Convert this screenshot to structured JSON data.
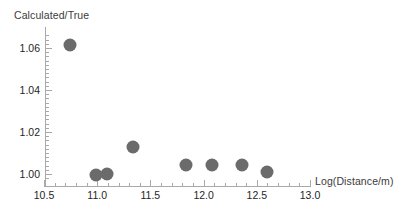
{
  "chart_data": {
    "type": "scatter",
    "title": "",
    "xlabel": "Log(Distance/m)",
    "ylabel": "Calculated/True",
    "xlim": [
      10.4,
      13.05
    ],
    "ylim": [
      0.9955,
      1.069
    ],
    "grid": false,
    "legend": null,
    "marker": {
      "shape": "circle",
      "color": "#6b6b6b",
      "diameter_px": 13
    },
    "xticks": [
      "10.5",
      "11.0",
      "11.5",
      "12.0",
      "12.5",
      "13.0"
    ],
    "xtick_values": [
      10.5,
      11.0,
      11.5,
      12.0,
      12.5,
      13.0
    ],
    "yticks": [
      "1.00",
      "1.02",
      "1.04",
      "1.06"
    ],
    "ytick_values": [
      1.0,
      1.02,
      1.04,
      1.06
    ],
    "x": [
      10.74,
      10.99,
      11.09,
      11.34,
      11.83,
      12.08,
      12.36,
      12.6
    ],
    "y": [
      1.0614,
      0.9995,
      1.0,
      1.0128,
      1.0042,
      1.0042,
      1.0042,
      1.0011
    ],
    "points": [
      {
        "x": 10.74,
        "y": 1.0614
      },
      {
        "x": 10.99,
        "y": 0.9995
      },
      {
        "x": 11.09,
        "y": 1.0
      },
      {
        "x": 11.34,
        "y": 1.0128
      },
      {
        "x": 11.83,
        "y": 1.0042
      },
      {
        "x": 12.08,
        "y": 1.0042
      },
      {
        "x": 12.36,
        "y": 1.0042
      },
      {
        "x": 12.6,
        "y": 1.0011
      }
    ]
  }
}
